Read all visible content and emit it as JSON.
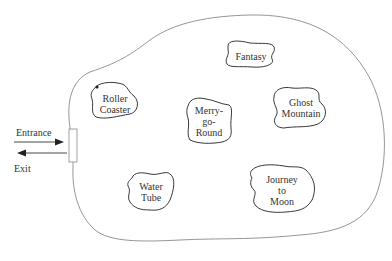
{
  "diagram": {
    "colors": {
      "boundary": "#888888",
      "ride_outline": "#222222",
      "text": "#333333"
    },
    "entrance_label": "Entrance",
    "exit_label": "Exit",
    "rides": [
      {
        "name": "Fantasy",
        "lines": [
          "Fantasy"
        ]
      },
      {
        "name": "Roller Coaster",
        "lines": [
          "Roller",
          "Coaster"
        ]
      },
      {
        "name": "Merry-go-Round",
        "lines": [
          "Merry-",
          "go-",
          "Round"
        ]
      },
      {
        "name": "Ghost Mountain",
        "lines": [
          "Ghost",
          "Mountain"
        ]
      },
      {
        "name": "Water Tube",
        "lines": [
          "Water",
          "Tube"
        ]
      },
      {
        "name": "Journey to Moon",
        "lines": [
          "Journey",
          "to",
          "Moon"
        ]
      }
    ]
  }
}
